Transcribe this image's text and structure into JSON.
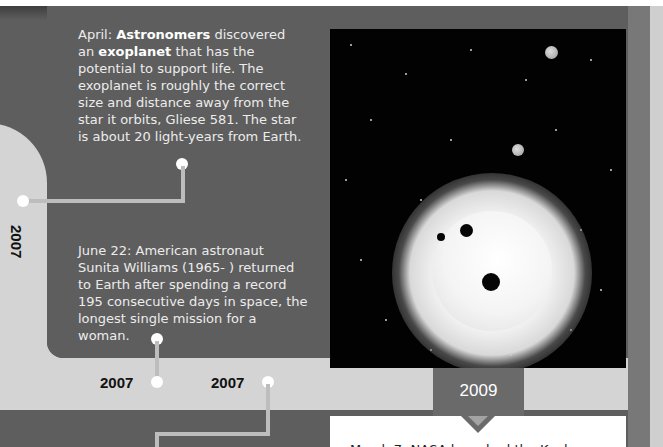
{
  "events": {
    "exoplanet": {
      "prefix": "April: ",
      "bold1": "Astronomers",
      "mid1": " discovered an",
      "bold2": "exoplanet",
      "rest": " that has the potential to support life. The exoplanet is roughly the correct size and distance away from the star it orbits, Gliese 581. The star is about 20 light-years from Earth."
    },
    "williams": {
      "text": "June 22: American astronaut Sunita Williams (1965-   ) returned to Earth after spending a record 195 consecutive days in space, the longest single mission for a woman."
    },
    "kepler": {
      "text": "March 7: NASA launched the Kepler"
    }
  },
  "timeline": {
    "year_vertical": "2007",
    "year_bottom_1": "2007",
    "year_bottom_2": "2007",
    "year_tab": "2009"
  },
  "image": {
    "description": "Artist illustration of a bright star with three dark planets transiting and two gray planets in starry space"
  },
  "colors": {
    "page_background": "#5e5e5e",
    "track": "#d4d4d4",
    "year_tab": "#6a6a6a",
    "text_light": "#ececec",
    "year_text": "#111111"
  }
}
